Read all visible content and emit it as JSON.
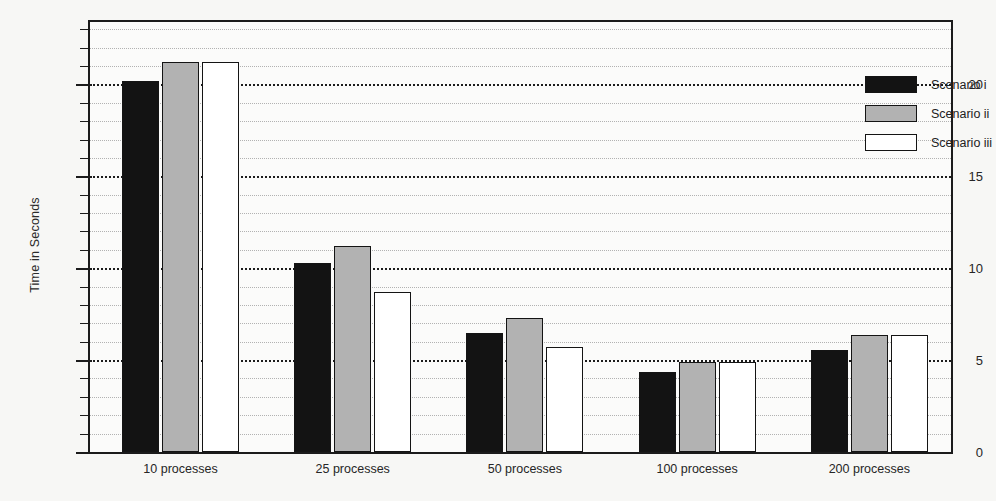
{
  "chart_data": {
    "type": "bar",
    "title": "",
    "xlabel": "",
    "ylabel": "Time in Seconds",
    "ylim": [
      0,
      23.4
    ],
    "yticks": [
      0,
      5,
      10,
      15,
      20
    ],
    "ytick_labels": [
      "0",
      "5",
      "10",
      "15",
      "20"
    ],
    "minor_tick_step": 1,
    "grid": "horizontal dotted, major bold at every 5 units, minor fine at every 1 unit",
    "legend_position": "top-right inside plot area",
    "categories": [
      "10 processes",
      "25 processes",
      "50 processes",
      "100 processes",
      "200 processes"
    ],
    "series": [
      {
        "name": "Scenario i",
        "color": "#131313",
        "values": [
          20.2,
          10.3,
          6.5,
          4.35,
          5.55
        ]
      },
      {
        "name": "Scenario ii",
        "color": "#b2b2b2",
        "values": [
          21.2,
          11.2,
          7.3,
          4.9,
          6.35
        ]
      },
      {
        "name": "Scenario iii",
        "color": "#ffffff",
        "values": [
          21.2,
          8.7,
          5.7,
          4.9,
          6.35
        ]
      }
    ]
  },
  "legend": {
    "entries": [
      {
        "label": "Scenario i",
        "color": "#131313"
      },
      {
        "label": "Scenario ii",
        "color": "#b2b2b2"
      },
      {
        "label": "Scenario iii",
        "color": "#ffffff"
      }
    ]
  },
  "colors": {
    "background": "#f7f7f5",
    "plot_background": "#fbfbfa",
    "axis": "#1b1b1b",
    "gridline_major": "#1c1c1c",
    "gridline_minor": "#9a9a9a",
    "bar_border": "#141414"
  }
}
